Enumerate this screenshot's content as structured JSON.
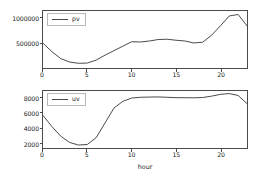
{
  "chart_data": [
    {
      "id": "pv-panel",
      "type": "line",
      "title": "",
      "xlabel": "",
      "ylabel": "",
      "legend": "pv",
      "legend_position": "upper left",
      "grid": false,
      "xlim": [
        0,
        23
      ],
      "ylim": [
        0,
        1150000
      ],
      "xticks": [
        0,
        5,
        10,
        15,
        20
      ],
      "xtick_labels": [
        "0",
        "5",
        "10",
        "15",
        "20"
      ],
      "yticks": [
        500000,
        1000000
      ],
      "ytick_labels": [
        "500000",
        "1000000"
      ],
      "x": [
        0,
        1,
        2,
        3,
        4,
        5,
        6,
        7,
        8,
        9,
        10,
        11,
        12,
        13,
        14,
        15,
        16,
        17,
        18,
        19,
        20,
        21,
        22,
        23
      ],
      "values": [
        500000,
        330000,
        190000,
        120000,
        95000,
        100000,
        160000,
        260000,
        350000,
        440000,
        530000,
        525000,
        545000,
        575000,
        580000,
        560000,
        545000,
        505000,
        520000,
        660000,
        850000,
        1050000,
        1080000,
        850000
      ],
      "series": [
        {
          "name": "pv",
          "color": "#4b4b4b",
          "values": [
            500000,
            330000,
            190000,
            120000,
            95000,
            100000,
            160000,
            260000,
            350000,
            440000,
            530000,
            525000,
            545000,
            575000,
            580000,
            560000,
            545000,
            505000,
            520000,
            660000,
            850000,
            1050000,
            1080000,
            850000
          ]
        }
      ]
    },
    {
      "id": "uv-panel",
      "type": "line",
      "title": "",
      "xlabel": "hour",
      "ylabel": "",
      "legend": "uv",
      "legend_position": "upper left",
      "grid": false,
      "xlim": [
        0,
        23
      ],
      "ylim": [
        1300,
        9000
      ],
      "xticks": [
        0,
        5,
        10,
        15,
        20
      ],
      "xtick_labels": [
        "0",
        "5",
        "10",
        "15",
        "20"
      ],
      "yticks": [
        2000,
        4000,
        6000,
        8000
      ],
      "ytick_labels": [
        "2000",
        "4000",
        "6000",
        "8000"
      ],
      "x": [
        0,
        1,
        2,
        3,
        4,
        5,
        6,
        7,
        8,
        9,
        10,
        11,
        12,
        13,
        14,
        15,
        16,
        17,
        18,
        19,
        20,
        21,
        22,
        23
      ],
      "values": [
        5700,
        4200,
        2900,
        2050,
        1700,
        1780,
        2700,
        4700,
        6700,
        7600,
        8050,
        8150,
        8180,
        8200,
        8150,
        8100,
        8090,
        8080,
        8120,
        8300,
        8550,
        8650,
        8400,
        7300
      ],
      "series": [
        {
          "name": "uv",
          "color": "#4b4b4b",
          "values": [
            5700,
            4200,
            2900,
            2050,
            1700,
            1780,
            2700,
            4700,
            6700,
            7600,
            8050,
            8150,
            8180,
            8200,
            8150,
            8100,
            8090,
            8080,
            8120,
            8300,
            8550,
            8650,
            8400,
            7300
          ]
        }
      ]
    }
  ],
  "figure": {
    "background": "#ffffff",
    "line_color": "#4b4b4b",
    "axis_color": "#4a4a4a",
    "text_color": "#1a1a1a"
  }
}
